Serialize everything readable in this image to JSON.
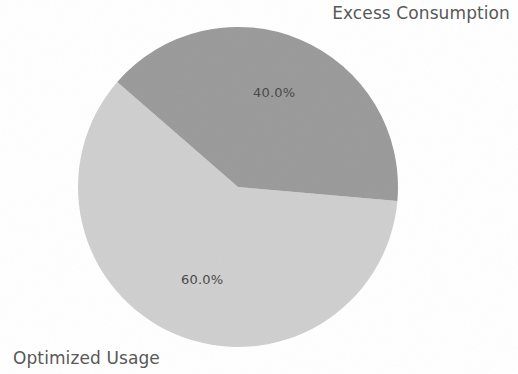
{
  "chart_data": {
    "type": "pie",
    "title": "",
    "categories": [
      "Excess Consumption",
      "Optimized Usage"
    ],
    "values": [
      40.0,
      60.0
    ],
    "value_labels": [
      "40.0%",
      "60.0%"
    ],
    "units": "percent",
    "legend": "none",
    "labels_position": "outside-callout",
    "grid": false,
    "background_color": "#ffffff",
    "series": [
      {
        "name": "Excess Consumption",
        "value": 40.0,
        "value_label": "40.0%",
        "color": "#9a9a9a",
        "start_angle_deg": -5.0,
        "end_angle_deg": 139.0
      },
      {
        "name": "Optimized Usage",
        "value": 60.0,
        "value_label": "60.0%",
        "color": "#cfcfcf",
        "start_angle_deg": 139.0,
        "end_angle_deg": 355.0
      }
    ],
    "geometry": {
      "center_x": 238,
      "center_y": 187,
      "radius": 160
    }
  },
  "labels": {
    "excess_consumption": "Excess Consumption",
    "optimized_usage": "Optimized Usage",
    "excess_consumption_pct": "40.0%",
    "optimized_usage_pct": "60.0%"
  },
  "colors": {
    "slice_excess": "#9a9a9a",
    "slice_optimized": "#cfcfcf",
    "label_text": "#585858",
    "pct_text": "#4a4a4a",
    "background": "#ffffff"
  }
}
